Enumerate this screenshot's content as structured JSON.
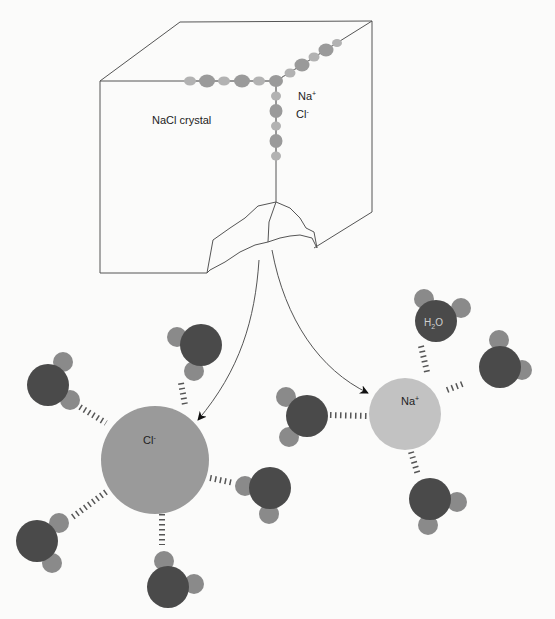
{
  "diagram": {
    "crystal": {
      "label": "NaCl crystal",
      "legend_na": "Na+",
      "legend_cl": "Cl-"
    },
    "ions": {
      "chloride": {
        "label": "Cl-",
        "label_base": "Cl",
        "label_sup": "-"
      },
      "sodium": {
        "label": "Na+",
        "label_base": "Na",
        "label_sup": "+"
      }
    },
    "water": {
      "label": "H2O",
      "label_base": "H",
      "label_sub": "2",
      "label_end": "O"
    }
  },
  "colors": {
    "background": "#fbfbfa",
    "outline": "#555555",
    "chloride": "#9a9a9a",
    "sodium": "#c2c2c2",
    "oxygen": "#4a4a4a",
    "hydrogen": "#8a8a8a",
    "bond": "#555555",
    "arrow": "#111111"
  }
}
